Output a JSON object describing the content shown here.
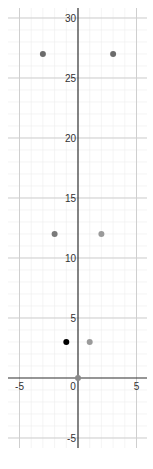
{
  "chart_data": {
    "type": "scatter",
    "title": "",
    "xlabel": "",
    "ylabel": "",
    "xlim": [
      -6,
      5.9
    ],
    "ylim": [
      -6,
      31.5
    ],
    "grid": true,
    "x_ticks": [
      -5,
      0,
      5
    ],
    "y_ticks": [
      -5,
      5,
      10,
      15,
      20,
      25,
      30
    ],
    "x_tick_labels": [
      "-5",
      "0",
      "5"
    ],
    "y_tick_labels": [
      "-5",
      "5",
      "10",
      "15",
      "20",
      "25",
      "30"
    ],
    "points": [
      {
        "x": -3,
        "y": 27,
        "color": "#6b6b6b"
      },
      {
        "x": 3,
        "y": 27,
        "color": "#6b6b6b"
      },
      {
        "x": -2,
        "y": 12,
        "color": "#7a7a7a"
      },
      {
        "x": 2,
        "y": 12,
        "color": "#9a9a9a"
      },
      {
        "x": -1,
        "y": 3,
        "color": "#000000"
      },
      {
        "x": 1,
        "y": 3,
        "color": "#9a9a9a"
      },
      {
        "x": 0,
        "y": 0,
        "color": "#8a8a8a"
      }
    ],
    "legend": []
  },
  "colors": {
    "axis": "#333333",
    "major_grid": "#cfcfcf",
    "minor_grid": "#ececec"
  }
}
